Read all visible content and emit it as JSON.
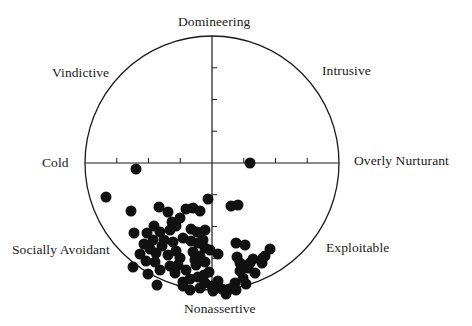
{
  "chart_data": {
    "type": "scatter",
    "title": "",
    "subtitle": "",
    "plot_shape": "circumplex circle",
    "center_px": [
      212,
      163
    ],
    "radius_px": 127,
    "axis_range": [
      -4,
      4
    ],
    "tick_spacing_px": 31.75,
    "grid": false,
    "legend": null,
    "octant_labels": {
      "top": "Domineering",
      "top_right": "Intrusive",
      "right": "Overly Nurturant",
      "bottom_right": "Exploitable",
      "bottom": "Nonassertive",
      "bottom_left": "Socially Avoidant",
      "left": "Cold",
      "top_left": "Vindictive"
    },
    "xlabel": "",
    "ylabel": "",
    "point_radius_px": 5.5,
    "points_px": [
      [
        250,
        163
      ],
      [
        136,
        169
      ],
      [
        106,
        197
      ],
      [
        131,
        211
      ],
      [
        159,
        207
      ],
      [
        168,
        212
      ],
      [
        172,
        222
      ],
      [
        186,
        209
      ],
      [
        193,
        208
      ],
      [
        200,
        211
      ],
      [
        208,
        199
      ],
      [
        134,
        233
      ],
      [
        147,
        233
      ],
      [
        154,
        226
      ],
      [
        160,
        232
      ],
      [
        164,
        240
      ],
      [
        176,
        226
      ],
      [
        180,
        218
      ],
      [
        170,
        230
      ],
      [
        183,
        238
      ],
      [
        191,
        229
      ],
      [
        197,
        232
      ],
      [
        205,
        230
      ],
      [
        203,
        240
      ],
      [
        144,
        244
      ],
      [
        150,
        249
      ],
      [
        153,
        240
      ],
      [
        162,
        246
      ],
      [
        173,
        242
      ],
      [
        176,
        251
      ],
      [
        191,
        241
      ],
      [
        198,
        243
      ],
      [
        205,
        248
      ],
      [
        140,
        254
      ],
      [
        156,
        253
      ],
      [
        168,
        255
      ],
      [
        180,
        258
      ],
      [
        193,
        252
      ],
      [
        200,
        256
      ],
      [
        210,
        250
      ],
      [
        218,
        254
      ],
      [
        133,
        267
      ],
      [
        146,
        261
      ],
      [
        155,
        262
      ],
      [
        160,
        270
      ],
      [
        170,
        266
      ],
      [
        178,
        265
      ],
      [
        186,
        270
      ],
      [
        196,
        265
      ],
      [
        205,
        262
      ],
      [
        209,
        272
      ],
      [
        148,
        274
      ],
      [
        157,
        285
      ],
      [
        175,
        273
      ],
      [
        183,
        282
      ],
      [
        190,
        279
      ],
      [
        198,
        277
      ],
      [
        205,
        283
      ],
      [
        212,
        286
      ],
      [
        218,
        281
      ],
      [
        222,
        289
      ],
      [
        229,
        289
      ],
      [
        235,
        283
      ],
      [
        231,
        206
      ],
      [
        238,
        205
      ],
      [
        236,
        243
      ],
      [
        245,
        245
      ],
      [
        237,
        257
      ],
      [
        240,
        263
      ],
      [
        240,
        271
      ],
      [
        248,
        268
      ],
      [
        250,
        263
      ],
      [
        253,
        259
      ],
      [
        262,
        263
      ],
      [
        265,
        256
      ],
      [
        270,
        249
      ],
      [
        263,
        258
      ],
      [
        255,
        273
      ],
      [
        243,
        278
      ],
      [
        246,
        284
      ],
      [
        236,
        290
      ],
      [
        226,
        294
      ],
      [
        213,
        291
      ],
      [
        200,
        288
      ],
      [
        190,
        290
      ],
      [
        183,
        286
      ],
      [
        204,
        275
      ],
      [
        195,
        260
      ]
    ]
  },
  "labels": {
    "top": "Domineering",
    "top_left": "Vindictive",
    "top_right": "Intrusive",
    "left": "Cold",
    "right": "Overly Nurturant",
    "bottom_left": "Socially Avoidant",
    "bottom_right": "Exploitable",
    "bottom": "Nonassertive"
  }
}
